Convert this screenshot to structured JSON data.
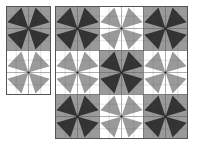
{
  "colors": {
    "background": "#ffffff",
    "dark": "#333333",
    "gray": "#9a9a9a",
    "light": "#ffffff",
    "line": "#555555"
  },
  "block_size": 44,
  "blade": {
    "outer_a": [
      0.68,
      0.04
    ],
    "outer_b": [
      0.04,
      0.72
    ]
  },
  "panels": [
    {
      "name": "left-panel",
      "x": 6,
      "y": 6,
      "rows": 2,
      "cols": 1,
      "blocks": [
        [
          "dark-on-gray"
        ],
        [
          "gray-on-white"
        ]
      ]
    },
    {
      "name": "right-panel",
      "x": 55,
      "y": 6,
      "rows": 3,
      "cols": 3,
      "blocks": [
        [
          "dark-on-gray",
          "gray-on-white",
          "dark-on-gray"
        ],
        [
          "gray-on-white",
          "dark-on-gray",
          "gray-on-white"
        ],
        [
          "dark-on-gray",
          "gray-on-white",
          "dark-on-gray"
        ]
      ]
    }
  ],
  "block_types": {
    "dark-on-gray": {
      "bg": "#9a9a9a",
      "fg": "#333333"
    },
    "gray-on-white": {
      "bg": "#ffffff",
      "fg": "#9a9a9a"
    }
  }
}
